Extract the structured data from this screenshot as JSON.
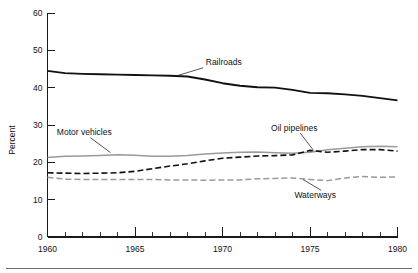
{
  "chart_data": {
    "type": "line",
    "title": "",
    "xlabel": "",
    "ylabel": "Percent",
    "xlim": [
      1960,
      1980
    ],
    "ylim": [
      0,
      60
    ],
    "grid": false,
    "legend_position": "inline-annotations",
    "y_ticks": [
      "0",
      "10",
      "20",
      "30",
      "40",
      "50",
      "60"
    ],
    "x_ticks_major": [
      "1960",
      "1965",
      "1970",
      "1975",
      "1980"
    ],
    "x_minor_tick_interval": 1,
    "x": [
      1960,
      1961,
      1962,
      1963,
      1964,
      1965,
      1966,
      1967,
      1968,
      1969,
      1970,
      1971,
      1972,
      1973,
      1974,
      1975,
      1976,
      1977,
      1978,
      1979,
      1980
    ],
    "series": [
      {
        "name": "Railroads",
        "style": "solid",
        "color": "#111111",
        "width": 1.9,
        "values": [
          44.5,
          43.9,
          43.7,
          43.6,
          43.5,
          43.4,
          43.3,
          43.2,
          43.0,
          42.2,
          41.2,
          40.5,
          40.1,
          40.0,
          39.4,
          38.6,
          38.5,
          38.2,
          37.8,
          37.2,
          36.6
        ]
      },
      {
        "name": "Motor vehicles",
        "style": "solid",
        "color": "#9a9a9a",
        "width": 1.5,
        "values": [
          21.3,
          21.6,
          21.7,
          21.8,
          22.0,
          21.9,
          21.6,
          21.6,
          21.8,
          22.2,
          22.5,
          22.7,
          22.8,
          22.6,
          22.4,
          22.7,
          23.4,
          23.8,
          24.2,
          24.3,
          24.2
        ]
      },
      {
        "name": "Oil pipelines",
        "style": "dashed",
        "color": "#111111",
        "width": 1.6,
        "dash": "6,3",
        "values": [
          17.2,
          17.1,
          17.0,
          17.1,
          17.2,
          17.6,
          18.3,
          19.0,
          19.6,
          20.4,
          21.1,
          21.4,
          21.7,
          21.8,
          22.0,
          23.2,
          22.7,
          23.0,
          23.4,
          23.4,
          23.0
        ]
      },
      {
        "name": "Waterways",
        "style": "dashed",
        "color": "#9a9a9a",
        "width": 1.5,
        "dash": "6,3",
        "values": [
          16.0,
          15.5,
          15.4,
          15.4,
          15.4,
          15.4,
          15.4,
          15.3,
          15.3,
          15.2,
          15.3,
          15.3,
          15.6,
          15.7,
          15.8,
          15.4,
          15.1,
          15.8,
          16.2,
          16.0,
          16.1
        ]
      }
    ],
    "annotations": [
      {
        "text": "Railroads",
        "x": 1968.7,
        "y": 46.0
      },
      {
        "text": "Motor vehicles",
        "x": 1962.1,
        "y": 27.3
      },
      {
        "text": "Oil pipelines",
        "x": 1974.1,
        "y": 28.5
      },
      {
        "text": "Waterways",
        "x": 1975.3,
        "y": 10.5
      }
    ]
  }
}
